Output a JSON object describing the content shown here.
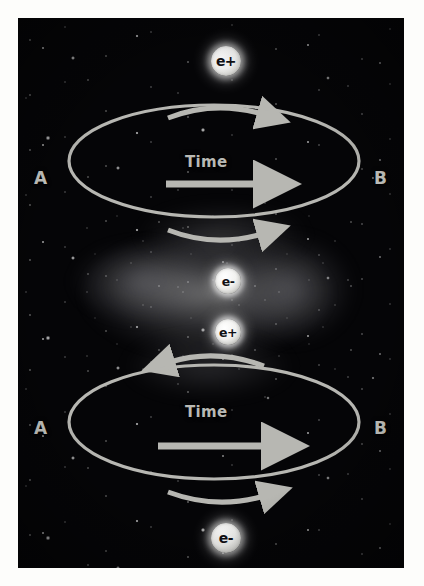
{
  "figure": {
    "background_color": "#fdfdfb",
    "plate_color": "#050507",
    "stroke_color": "#b7b7b2",
    "label_color": "#c9c9c4"
  },
  "loops": [
    {
      "id": "top-loop",
      "axis_start_label": "A",
      "axis_end_label": "B",
      "axis_caption": "Time",
      "axis_arrow_direction": "right",
      "outer_arrow_above": {
        "direction": "right"
      },
      "outer_arrow_below": {
        "direction": "right"
      }
    },
    {
      "id": "bottom-loop",
      "axis_start_label": "A",
      "axis_end_label": "B",
      "axis_caption": "Time",
      "axis_arrow_direction": "right",
      "outer_arrow_above": {
        "direction": "left"
      },
      "outer_arrow_below": {
        "direction": "right"
      }
    }
  ],
  "particles": [
    {
      "id": "particle-top",
      "label": "e+",
      "position": "above-top-loop"
    },
    {
      "id": "particle-mid-upper",
      "label": "e-",
      "position": "between-loops-upper"
    },
    {
      "id": "particle-mid-lower",
      "label": "e+",
      "position": "between-loops-lower"
    },
    {
      "id": "particle-bottom",
      "label": "e-",
      "position": "below-bottom-loop"
    }
  ]
}
